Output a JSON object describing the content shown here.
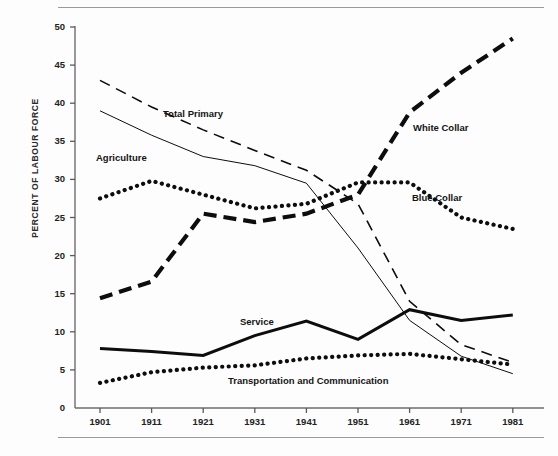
{
  "figure": {
    "number": "",
    "caption_partial": ""
  },
  "chart_data": {
    "type": "line",
    "title": "",
    "xlabel": "",
    "ylabel": "PERCENT OF LABOUR FORCE",
    "x": [
      1901,
      1911,
      1921,
      1931,
      1941,
      1951,
      1961,
      1971,
      1981
    ],
    "xticklabels": [
      "1901",
      "1911",
      "1921",
      "1931",
      "1941",
      "1951",
      "1961",
      "1971",
      "1981"
    ],
    "yticklabels": [
      "0",
      "5",
      "10",
      "15",
      "20",
      "25",
      "30",
      "35",
      "40",
      "45",
      "50"
    ],
    "xlim": [
      1901,
      1981
    ],
    "ylim": [
      0,
      50
    ],
    "grid": false,
    "legend_position": "inline-annotations",
    "series": [
      {
        "name": "Total Primary",
        "style": "long-dash",
        "label_x": 163,
        "label_y": 108,
        "values": [
          43.0,
          39.5,
          36.5,
          33.8,
          31.2,
          26.8,
          14.0,
          8.3,
          6.0
        ]
      },
      {
        "name": "Agriculture",
        "style": "thin-solid",
        "label_x": 96,
        "label_y": 152,
        "values": [
          39.0,
          35.8,
          33.0,
          31.8,
          29.5,
          21.0,
          11.5,
          6.8,
          4.5
        ]
      },
      {
        "name": "Blue Collar",
        "style": "dotted",
        "label_x": 412,
        "label_y": 192,
        "values": [
          27.5,
          29.8,
          28.0,
          26.2,
          26.8,
          29.6,
          29.6,
          25.0,
          23.5
        ]
      },
      {
        "name": "White Collar",
        "style": "thick-dash",
        "label_x": 413,
        "label_y": 122,
        "values": [
          14.4,
          16.6,
          25.5,
          24.4,
          25.5,
          28.0,
          38.8,
          44.0,
          48.5
        ]
      },
      {
        "name": "Service",
        "style": "thick-solid",
        "label_x": 240,
        "label_y": 316,
        "values": [
          7.8,
          7.4,
          6.9,
          9.5,
          11.4,
          9.0,
          12.9,
          11.5,
          12.2
        ]
      },
      {
        "name": "Transportation and Communication",
        "style": "dotted",
        "label_x": 228,
        "label_y": 375,
        "values": [
          3.3,
          4.7,
          5.3,
          5.6,
          6.5,
          6.9,
          7.1,
          6.4,
          5.7
        ]
      }
    ]
  },
  "axis": {
    "tick_color": "#5a5a5a",
    "line_color": "#6d6d6d"
  }
}
